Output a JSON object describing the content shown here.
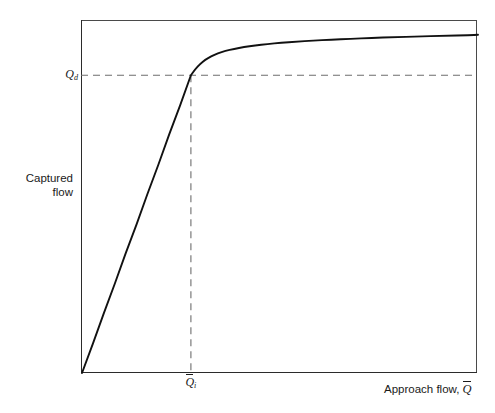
{
  "figure": {
    "background_color": "#ffffff",
    "line_color": "#111111",
    "dash_color": "#6e6e6e",
    "frame_color": "#4a4a4a",
    "width": 495,
    "height": 413
  },
  "axes": {
    "y_title_line1": "Captured",
    "y_title_line2": "flow",
    "x_title_text": "Approach flow,",
    "x_title_symbol": "Q",
    "x_title_symbol_overbar": true,
    "y_tick_symbol": "Q",
    "y_tick_subscript": "d",
    "x_tick_symbol": "Q",
    "x_tick_subscript": "i",
    "x_tick_overbar": true
  },
  "chart_data": {
    "type": "line",
    "title": "",
    "subtitle": "",
    "xlabel": "Approach flow, Q̄",
    "ylabel": "Captured flow",
    "grid": false,
    "legend": null,
    "axis_ticks_numeric": false,
    "xlim": [
      0,
      1
    ],
    "ylim": [
      0,
      1
    ],
    "annotations": [
      {
        "name": "design-capture-flow",
        "label": "Q_d",
        "type": "horizontal-dashed-line",
        "y": 0.868,
        "x_start": 0.0,
        "x_end": 1.0
      },
      {
        "name": "inlet-design-approach-flow",
        "label": "Q̄_i",
        "type": "vertical-dashed-line",
        "x": 0.275,
        "y_start": 0.0,
        "y_end": 0.868
      },
      {
        "name": "knee-point",
        "label": "(Q̄_i, Q_d)",
        "type": "point",
        "x": 0.275,
        "y": 0.868
      }
    ],
    "series": [
      {
        "name": "captured-flow-curve",
        "color": "#111111",
        "width": 1.9,
        "x": [
          0.0,
          0.028,
          0.055,
          0.083,
          0.11,
          0.138,
          0.165,
          0.193,
          0.22,
          0.248,
          0.275,
          0.286,
          0.298,
          0.311,
          0.326,
          0.343,
          0.362,
          0.384,
          0.409,
          0.437,
          0.468,
          0.503,
          0.541,
          0.583,
          0.629,
          0.678,
          0.731,
          0.788,
          0.848,
          0.912,
          0.98,
          1.0
        ],
        "y": [
          0.0,
          0.087,
          0.174,
          0.261,
          0.348,
          0.434,
          0.521,
          0.608,
          0.695,
          0.781,
          0.868,
          0.886,
          0.901,
          0.913,
          0.923,
          0.932,
          0.939,
          0.945,
          0.95,
          0.955,
          0.959,
          0.963,
          0.966,
          0.969,
          0.972,
          0.974,
          0.977,
          0.979,
          0.981,
          0.983,
          0.985,
          0.986
        ]
      }
    ]
  },
  "geometry": {
    "plot_left_px": 81,
    "plot_top_px": 20,
    "plot_right_px": 477,
    "plot_bottom_px": 373,
    "curve_path": "M 82,372 L 188,66 C 196,54 204,46 214,42 C 228,36 244,34 264,33 C 292,32 330,31.6 370,31.2 C 410,30.9 445,30.7 476,30.5",
    "hdash_y_px": 66,
    "hdash_x_start_px": 82,
    "hdash_x_end_px": 477,
    "vdash_x_px": 189,
    "vdash_y_start_px": 66,
    "vdash_y_end_px": 372
  }
}
